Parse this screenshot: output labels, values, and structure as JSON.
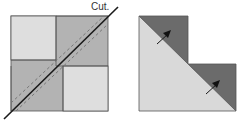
{
  "labels": {
    "cut": "Cut."
  },
  "colors": {
    "light_fabric": "#dcdcdc",
    "medium_fabric": "#b0b0b0",
    "dark_fabric": "#6b6b6b",
    "lighter_fabric": "#d9d9d9",
    "outline": "#555555",
    "cut_line": "#1a1a1a",
    "seam_dashes": "#777777"
  },
  "figures": [
    {
      "name": "four-patch-square-with-diagonal-cut"
    },
    {
      "name": "cut-half-triangle-unit-with-press-arrows"
    }
  ]
}
